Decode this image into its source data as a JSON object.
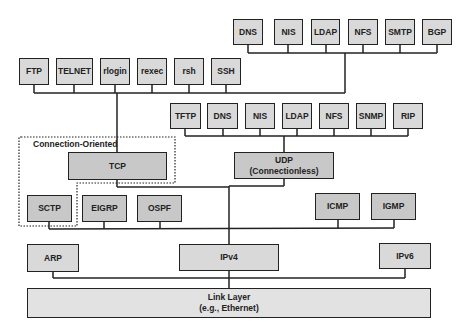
{
  "diagram": {
    "type": "TCP/IP protocol stack",
    "row1_apps": [
      "DNS",
      "NIS",
      "LDAP",
      "NFS",
      "SMTP",
      "BGP"
    ],
    "row2_apps": [
      "FTP",
      "TELNET",
      "rlogin",
      "rexec",
      "rsh",
      "SSH"
    ],
    "row3_apps": [
      "TFTP",
      "DNS",
      "NIS",
      "LDAP",
      "NFS",
      "SNMP",
      "RIP"
    ],
    "group_label": "Connection-Oriented",
    "tcp": "TCP",
    "udp_line1": "UDP",
    "udp_line2": "(Connectionless)",
    "sctp": "SCTP",
    "eigrp": "EIGRP",
    "ospf": "OSPF",
    "icmp": "ICMP",
    "igmp": "IGMP",
    "arp": "ARP",
    "ipv4": "IPv4",
    "ipv6": "IPv6",
    "link_line1": "Link Layer",
    "link_line2": "(e.g., Ethernet)"
  },
  "colors": {
    "box_fill": "#d9d9d9",
    "box_fill_dark": "#c8c8c8",
    "stroke": "#222222"
  }
}
